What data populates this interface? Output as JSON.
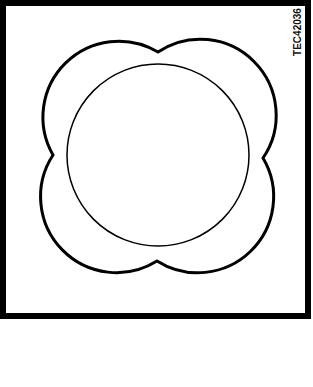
{
  "figure": {
    "code": "TEC42036",
    "colors": {
      "stroke": "#000000",
      "background": "#ffffff"
    },
    "shapes": [
      {
        "type": "frame",
        "description": "square border"
      },
      {
        "type": "four-lobed-outline",
        "description": "quatrefoil / flower outline with four rounded lobes"
      },
      {
        "type": "circle",
        "description": "inner circle centered within the lobes"
      }
    ]
  }
}
